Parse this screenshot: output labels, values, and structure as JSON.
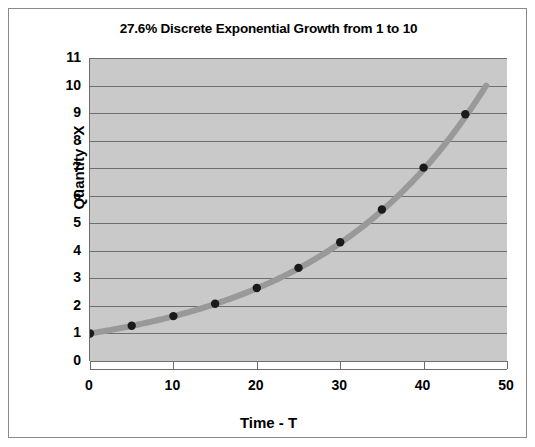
{
  "chart_data": {
    "type": "line",
    "title": "27.6% Discrete Exponential Growth from 1 to 10",
    "xlabel": "Time - T",
    "ylabel": "Quantity - X",
    "xlim": [
      0,
      50
    ],
    "ylim": [
      0,
      11
    ],
    "xticks": [
      0,
      10,
      20,
      30,
      40,
      50
    ],
    "yticks": [
      0,
      1,
      2,
      3,
      4,
      5,
      6,
      7,
      8,
      9,
      10,
      11
    ],
    "grid": "horizontal",
    "legend": "none",
    "growth_rate_percent": 27.6,
    "series": [
      {
        "name": "Quantity - X",
        "line_color": "#999999",
        "marker_color": "#1a1a1a",
        "x": [
          0,
          5,
          10,
          15,
          20,
          25,
          30,
          35,
          40,
          45,
          47.5
        ],
        "values": [
          1.0,
          1.28,
          1.63,
          2.08,
          2.65,
          3.38,
          4.31,
          5.5,
          7.02,
          8.96,
          10.0
        ]
      }
    ]
  },
  "axes": {
    "y_tick_labels": [
      "11",
      "10",
      "9",
      "8",
      "7",
      "6",
      "5",
      "4",
      "3",
      "2",
      "1",
      "0"
    ],
    "x_tick_labels": [
      "0",
      "10",
      "20",
      "30",
      "40",
      "50"
    ]
  },
  "colors": {
    "plot_background": "#c9c9c9",
    "gridline": "#6e6e6e",
    "line": "#999999",
    "marker": "#1a1a1a",
    "frame": "#8a8a8a"
  }
}
